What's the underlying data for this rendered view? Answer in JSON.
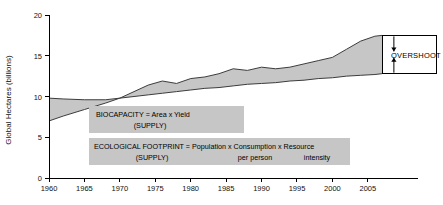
{
  "chart_data": {
    "type": "area",
    "title": "",
    "xlabel": "",
    "ylabel": "Global Hectares (billions)",
    "xlim": [
      1960,
      2007
    ],
    "ylim": [
      0,
      20
    ],
    "grid": false,
    "legend_position": "none",
    "x_ticks": [
      "1960",
      "1965",
      "1970",
      "1975",
      "1980",
      "1985",
      "1990",
      "1995",
      "2000",
      "2005"
    ],
    "y_ticks": [
      "0",
      "5",
      "10",
      "15",
      "20"
    ],
    "x": [
      1960,
      1962,
      1965,
      1968,
      1970,
      1972,
      1974,
      1976,
      1978,
      1980,
      1982,
      1984,
      1986,
      1988,
      1990,
      1992,
      1994,
      1996,
      1998,
      2000,
      2002,
      2004,
      2006,
      2007
    ],
    "series": [
      {
        "name": "Ecological Footprint",
        "values": [
          7.0,
          7.6,
          8.4,
          9.2,
          9.8,
          10.6,
          11.4,
          11.9,
          11.6,
          12.2,
          12.4,
          12.8,
          13.4,
          13.2,
          13.6,
          13.4,
          13.6,
          14.0,
          14.4,
          14.8,
          15.8,
          16.8,
          17.4,
          17.5
        ]
      },
      {
        "name": "Biocapacity",
        "values": [
          9.8,
          9.7,
          9.6,
          9.6,
          9.8,
          10.0,
          10.2,
          10.4,
          10.6,
          10.8,
          11.0,
          11.1,
          11.3,
          11.5,
          11.6,
          11.7,
          11.9,
          12.0,
          12.2,
          12.3,
          12.5,
          12.6,
          12.7,
          12.8
        ]
      }
    ],
    "annotations": [
      {
        "name": "overshoot",
        "label": "OVERSHOOT",
        "year": 2007,
        "upper_value": 17.5,
        "lower_value": 12.8
      }
    ],
    "callouts": [
      {
        "name": "biocapacity-definition",
        "line1": "BIOCAPACITY = Area x Yield",
        "line2": "(SUPPLY)"
      },
      {
        "name": "footprint-definition",
        "line1": "ECOLOGICAL FOOTPRINT = Population x Consumption x Resource",
        "line2": "(SUPPLY)",
        "sub1": "per person",
        "sub2": "intensity"
      }
    ],
    "colors": {
      "band_fill": "#c6c6c6",
      "line": "#3c3c3c",
      "axis": "#000000",
      "callout_background": "#c6c6c6",
      "page_background": "#ffffff"
    }
  }
}
